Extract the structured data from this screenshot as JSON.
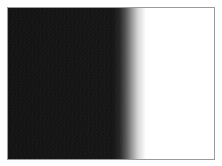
{
  "image": {
    "description": "Framed rectangle: noisy black left portion fading via horizontal gradient to white on the right",
    "colors": {
      "dark": "#141414",
      "light": "#ffffff",
      "border": "#9a9a9a"
    },
    "gradient_direction": "left-to-right",
    "text": []
  }
}
